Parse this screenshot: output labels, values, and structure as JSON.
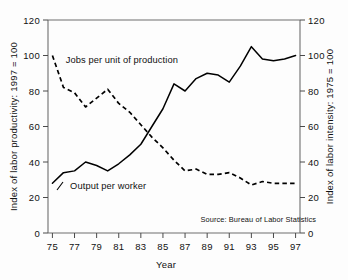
{
  "chart_data": {
    "type": "line",
    "title": "",
    "subtitle": "",
    "xlabel": "Year",
    "ylabel": "Index of labor productivity: 1997 = 100",
    "y2label": "Index of labor intensity: 1975 = 100",
    "xlim": [
      1974.6,
      1997.4
    ],
    "ylim": [
      0,
      120
    ],
    "y2lim": [
      0,
      120
    ],
    "yticks": [
      0,
      20,
      40,
      60,
      80,
      100,
      120
    ],
    "y2ticks": [
      0,
      20,
      40,
      60,
      80,
      100,
      120
    ],
    "xticks": [
      1975,
      1977,
      1979,
      1981,
      1983,
      1985,
      1987,
      1989,
      1991,
      1993,
      1995,
      1997
    ],
    "xticklabels": [
      "75",
      "77",
      "79",
      "81",
      "83",
      "85",
      "87",
      "89",
      "91",
      "93",
      "95",
      "97"
    ],
    "yticklabels": [
      "0",
      "20",
      "40",
      "60",
      "80",
      "100",
      "120"
    ],
    "y2ticklabels": [
      "0",
      "20",
      "40",
      "60",
      "80",
      "100",
      "120"
    ],
    "grid": false,
    "legend_position": "inline-annotation",
    "annotations": [
      {
        "text": "Jobs per unit of production",
        "x": 1976.2,
        "y": 96
      },
      {
        "text": "Output per worker",
        "x": 1976.6,
        "y": 25
      },
      {
        "text": "Source: Bureau of Labor Statistics",
        "x": 1988.4,
        "y": 6
      }
    ],
    "x": [
      1975,
      1976,
      1977,
      1978,
      1979,
      1980,
      1981,
      1982,
      1983,
      1984,
      1985,
      1986,
      1987,
      1988,
      1989,
      1990,
      1991,
      1992,
      1993,
      1994,
      1995,
      1996,
      1997
    ],
    "series": [
      {
        "name": "Output per worker",
        "style": "solid",
        "axis": "left",
        "values": [
          28,
          34,
          35,
          40,
          38,
          35,
          39,
          44,
          50,
          60,
          70,
          84,
          80,
          87,
          90,
          89,
          85,
          94,
          105,
          98,
          97,
          98,
          100
        ]
      },
      {
        "name": "Jobs per unit of production",
        "style": "dashed",
        "axis": "right",
        "values": [
          100,
          82,
          79,
          71,
          76,
          81,
          73,
          68,
          61,
          54,
          48,
          41,
          35,
          36,
          33,
          33,
          34,
          31,
          27,
          29,
          28,
          28,
          28
        ]
      }
    ]
  },
  "figure": {
    "background_color": "#fdfdfd",
    "line_color": "#000000",
    "frame_color": "#6e6e6e",
    "text_color": "#111111"
  }
}
